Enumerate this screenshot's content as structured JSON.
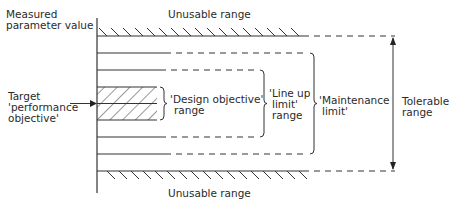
{
  "diagram": {
    "axis_label_line1": "Measured",
    "axis_label_line2": "parameter value",
    "top_region": "Unusable range",
    "bottom_region": "Unusable range",
    "target_line1": "Target",
    "target_line2": "'performance",
    "target_line3": "objective'",
    "design": {
      "line1": "'Design objective'",
      "line2": "range"
    },
    "lineup": {
      "line1": "'Line up",
      "line2": "limit'",
      "line3": "range"
    },
    "maintenance": {
      "line1": "'Maintenance",
      "line2": "limit'"
    },
    "tolerable": {
      "line1": "Tolerable",
      "line2": "range"
    }
  }
}
